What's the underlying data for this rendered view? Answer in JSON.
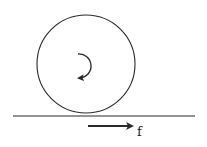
{
  "diagram": {
    "wheel": {
      "cx": 86,
      "cy": 64,
      "r": 49
    },
    "rotation": {
      "direction": "clockwise",
      "icon": "rotation-arrow"
    },
    "ground": {
      "x1": 13,
      "x2": 195,
      "y": 116
    },
    "force": {
      "label": "f",
      "direction": "right",
      "x1": 88,
      "x2": 135,
      "y": 126
    },
    "colors": {
      "stroke": "#2a2a2a",
      "background": "#ffffff"
    }
  }
}
